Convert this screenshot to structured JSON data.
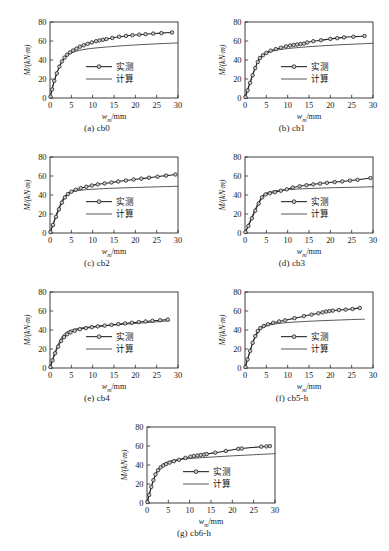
{
  "figure": {
    "axis": {
      "xlabel_var": "w",
      "xlabel_sub": "m",
      "xlabel_unit": "/mm",
      "ylabel": "M/(kN·m)",
      "ylabel_var": "M",
      "ylabel_unit": "/(kN·m)",
      "xticks": [
        "0",
        "5",
        "10",
        "15",
        "20",
        "25",
        "30"
      ],
      "yticks": [
        "0",
        "20",
        "40",
        "60",
        "80"
      ],
      "xlim": [
        0,
        30
      ],
      "ylim": [
        0,
        80
      ]
    },
    "legend": {
      "measured_label": "实测",
      "calculated_label": "计算"
    },
    "colors": {
      "measured_line": "#1f1f1f",
      "calculated_line": "#3a3a3a",
      "marker_fill": "#c9c9c9",
      "frame": "#2a2a2a",
      "background": "#ffffff"
    }
  },
  "chart_data": [
    {
      "type": "line",
      "panel": "a",
      "caption": "(a) cb0",
      "title": "cb0",
      "xlabel": "w_m/mm",
      "ylabel": "M/(kN·m)",
      "xlim": [
        0,
        30
      ],
      "ylim": [
        0,
        80
      ],
      "grid": false,
      "legend_position": "center",
      "series": [
        {
          "name": "实测",
          "marker": "circle",
          "x": [
            0.1,
            0.5,
            1.0,
            1.6,
            2.2,
            2.8,
            3.4,
            4.0,
            4.7,
            5.4,
            6.2,
            7.0,
            7.9,
            8.8,
            9.8,
            10.8,
            11.6,
            12.4,
            13.2,
            14.6,
            16.2,
            17.8,
            19.3,
            20.9,
            22.4,
            24.2,
            26.1,
            28.6
          ],
          "values": [
            1.5,
            9.0,
            18.0,
            26.0,
            33.0,
            38.5,
            42.5,
            45.5,
            48.0,
            50.0,
            52.0,
            54.0,
            55.5,
            57.0,
            58.5,
            59.8,
            60.6,
            61.3,
            62.0,
            63.2,
            64.5,
            65.4,
            66.1,
            66.7,
            67.2,
            67.8,
            68.3,
            69.0
          ]
        },
        {
          "name": "计算",
          "marker": "none",
          "x": [
            0,
            0.5,
            1.2,
            2.0,
            2.8,
            3.6,
            4.4,
            5.5,
            7.0,
            9.0,
            11.0,
            13.0,
            15.0,
            18.0,
            21.0,
            24.0,
            27.0,
            30.0
          ],
          "values": [
            0,
            10.0,
            21.0,
            31.0,
            38.5,
            43.0,
            46.0,
            48.3,
            50.2,
            51.8,
            52.8,
            53.6,
            54.3,
            55.3,
            56.1,
            56.8,
            57.4,
            58.0
          ]
        }
      ]
    },
    {
      "type": "line",
      "panel": "b",
      "caption": "(b) cb1",
      "title": "cb1",
      "xlabel": "w_m/mm",
      "ylabel": "M/(kN·m)",
      "xlim": [
        0,
        30
      ],
      "ylim": [
        0,
        80
      ],
      "grid": false,
      "legend_position": "center",
      "series": [
        {
          "name": "实测",
          "marker": "circle",
          "x": [
            0.1,
            0.6,
            1.2,
            1.8,
            2.4,
            3.0,
            3.5,
            4.2,
            5.0,
            6.0,
            7.2,
            8.4,
            9.6,
            10.6,
            11.4,
            12.2,
            13.0,
            13.8,
            14.6,
            16.0,
            17.8,
            20.0,
            21.6,
            23.2,
            25.4,
            28.0
          ],
          "values": [
            1.0,
            8.0,
            16.0,
            24.0,
            31.5,
            38.0,
            42.0,
            45.0,
            47.5,
            49.8,
            51.5,
            53.0,
            54.3,
            55.2,
            55.8,
            56.3,
            56.8,
            57.3,
            58.5,
            59.8,
            60.8,
            62.2,
            63.0,
            63.8,
            64.5,
            65.2
          ]
        },
        {
          "name": "计算",
          "marker": "none",
          "x": [
            0,
            0.6,
            1.4,
            2.2,
            3.0,
            3.8,
            4.8,
            6.0,
            8.0,
            10.0,
            12.0,
            15.0,
            18.0,
            21.0,
            24.0,
            27.0,
            30.0
          ],
          "values": [
            0,
            9.0,
            20.0,
            30.0,
            38.0,
            43.0,
            46.5,
            48.8,
            50.8,
            52.0,
            52.9,
            54.0,
            54.9,
            55.7,
            56.4,
            57.0,
            57.6
          ]
        }
      ]
    },
    {
      "type": "line",
      "panel": "c",
      "caption": "(c) cb2",
      "title": "cb2",
      "xlabel": "w_m/mm",
      "ylabel": "M/(kN·m)",
      "xlim": [
        0,
        30
      ],
      "ylim": [
        0,
        80
      ],
      "grid": false,
      "legend_position": "center",
      "series": [
        {
          "name": "实测",
          "marker": "circle",
          "x": [
            0.1,
            0.7,
            1.4,
            2.1,
            2.8,
            3.5,
            4.2,
            5.0,
            6.0,
            7.2,
            8.5,
            9.8,
            11.2,
            12.8,
            14.4,
            16.0,
            17.8,
            19.6,
            21.4,
            23.2,
            25.2,
            27.2,
            29.4
          ],
          "values": [
            1.0,
            8.5,
            17.0,
            25.0,
            32.0,
            37.5,
            41.0,
            43.5,
            45.5,
            47.2,
            48.6,
            50.0,
            51.2,
            52.2,
            53.2,
            54.2,
            55.3,
            56.3,
            57.2,
            58.2,
            59.3,
            60.4,
            61.6
          ]
        },
        {
          "name": "计算",
          "marker": "none",
          "x": [
            0,
            0.7,
            1.5,
            2.3,
            3.1,
            4.0,
            5.0,
            6.5,
            8.5,
            11.0,
            14.0,
            17.0,
            20.0,
            23.0,
            26.0,
            30.0
          ],
          "values": [
            0,
            9.5,
            20.0,
            29.0,
            36.5,
            41.0,
            43.2,
            44.6,
            45.6,
            46.3,
            47.0,
            47.5,
            47.9,
            48.3,
            48.7,
            49.2
          ]
        }
      ]
    },
    {
      "type": "line",
      "panel": "d",
      "caption": "(d) cb3",
      "title": "cb3",
      "xlabel": "w_m/mm",
      "ylabel": "M/(kN·m)",
      "xlim": [
        0,
        30
      ],
      "ylim": [
        0,
        80
      ],
      "grid": false,
      "legend_position": "center",
      "series": [
        {
          "name": "实测",
          "marker": "circle",
          "x": [
            0.1,
            0.8,
            1.6,
            2.4,
            3.2,
            4.0,
            4.8,
            5.8,
            7.0,
            8.4,
            9.8,
            11.2,
            12.8,
            14.4,
            16.0,
            17.6,
            19.2,
            21.0,
            22.8,
            24.6,
            26.4,
            29.4
          ],
          "values": [
            1.0,
            7.5,
            15.5,
            23.5,
            31.0,
            37.5,
            40.5,
            41.8,
            43.0,
            44.5,
            46.0,
            47.8,
            49.2,
            50.3,
            51.2,
            52.0,
            52.8,
            53.6,
            54.3,
            55.2,
            56.0,
            57.8
          ]
        },
        {
          "name": "计算",
          "marker": "none",
          "x": [
            0,
            0.8,
            1.7,
            2.6,
            3.5,
            4.4,
            5.5,
            7.0,
            9.0,
            12.0,
            15.0,
            18.0,
            21.0,
            24.0,
            27.0,
            30.0
          ],
          "values": [
            0,
            8.5,
            18.0,
            27.0,
            35.0,
            40.5,
            43.0,
            44.4,
            45.3,
            46.2,
            46.8,
            47.3,
            47.7,
            48.0,
            48.3,
            48.7
          ]
        }
      ]
    },
    {
      "type": "line",
      "panel": "e",
      "caption": "(e) cb4",
      "title": "cb4",
      "xlabel": "w_m/mm",
      "ylabel": "M/(kN·m)",
      "xlim": [
        0,
        30
      ],
      "ylim": [
        0,
        80
      ],
      "grid": false,
      "legend_position": "center",
      "series": [
        {
          "name": "实测",
          "marker": "circle",
          "x": [
            0.1,
            0.6,
            1.2,
            1.9,
            2.6,
            3.3,
            4.0,
            4.8,
            5.8,
            7.0,
            8.4,
            9.8,
            11.2,
            12.8,
            14.4,
            16.0,
            17.6,
            19.2,
            20.8,
            22.4,
            24.0,
            25.8,
            27.6
          ],
          "values": [
            1.0,
            8.0,
            15.5,
            22.5,
            28.5,
            32.5,
            35.5,
            37.5,
            39.2,
            40.8,
            42.0,
            43.0,
            43.8,
            44.6,
            45.4,
            46.2,
            46.9,
            47.6,
            48.3,
            49.0,
            49.7,
            50.3,
            51.0
          ]
        },
        {
          "name": "计算",
          "marker": "none",
          "x": [
            0,
            0.6,
            1.3,
            2.1,
            2.9,
            3.8,
            4.8,
            6.0,
            8.0,
            10.0,
            13.0,
            16.0,
            19.0,
            22.0,
            25.0,
            28.0
          ],
          "values": [
            0,
            9.0,
            18.5,
            27.0,
            33.5,
            37.5,
            39.8,
            41.2,
            42.6,
            43.5,
            44.6,
            45.6,
            46.6,
            47.6,
            48.6,
            49.8
          ]
        }
      ]
    },
    {
      "type": "line",
      "panel": "f",
      "caption": "(f) cb5-h",
      "title": "cb5-h",
      "xlabel": "w_m/mm",
      "ylabel": "M/(kN·m)",
      "xlim": [
        0,
        30
      ],
      "ylim": [
        0,
        80
      ],
      "grid": false,
      "legend_position": "center",
      "series": [
        {
          "name": "实测",
          "marker": "circle",
          "x": [
            0.1,
            0.6,
            1.2,
            1.8,
            2.4,
            3.0,
            3.6,
            4.4,
            5.4,
            6.6,
            8.0,
            9.4,
            11.6,
            13.8,
            15.6,
            17.2,
            18.2,
            19.0,
            19.8,
            20.6,
            22.0,
            23.6,
            25.2,
            26.9
          ],
          "values": [
            1.0,
            9.0,
            18.0,
            26.5,
            33.5,
            39.0,
            42.0,
            44.2,
            46.0,
            47.6,
            49.0,
            50.2,
            52.5,
            54.6,
            56.2,
            57.6,
            58.6,
            59.4,
            60.0,
            60.4,
            61.0,
            61.5,
            62.2,
            63.2
          ]
        },
        {
          "name": "计算",
          "marker": "none",
          "x": [
            0,
            0.6,
            1.3,
            2.0,
            2.8,
            3.6,
            4.6,
            6.0,
            8.0,
            10.5,
            13.0,
            16.0,
            19.0,
            22.0,
            25.0,
            28.0
          ],
          "values": [
            0,
            9.5,
            19.5,
            28.5,
            35.5,
            40.5,
            43.5,
            45.6,
            47.0,
            48.0,
            48.7,
            49.4,
            50.0,
            50.5,
            51.0,
            51.4
          ]
        }
      ]
    },
    {
      "type": "line",
      "panel": "g",
      "caption": "(g) cb6-h",
      "title": "cb6-h",
      "xlabel": "w_m/mm",
      "ylabel": "M/(kN·m)",
      "xlim": [
        0,
        30
      ],
      "ylim": [
        0,
        80
      ],
      "grid": false,
      "legend_position": "center",
      "series": [
        {
          "name": "实测",
          "marker": "circle",
          "x": [
            0.1,
            0.5,
            1.0,
            1.5,
            2.0,
            2.6,
            3.2,
            3.8,
            4.5,
            5.3,
            6.3,
            7.5,
            9.0,
            10.2,
            11.0,
            11.8,
            12.6,
            13.4,
            14.0,
            16.0,
            18.5,
            21.4,
            22.2,
            26.8,
            28.0,
            28.8
          ],
          "values": [
            1.0,
            8.5,
            17.0,
            24.0,
            30.0,
            34.5,
            37.5,
            39.5,
            41.0,
            42.5,
            44.0,
            45.5,
            47.5,
            48.8,
            49.5,
            50.0,
            50.5,
            51.0,
            51.5,
            53.0,
            54.8,
            57.0,
            57.3,
            59.3,
            59.6,
            59.9
          ]
        },
        {
          "name": "计算",
          "marker": "none",
          "x": [
            0,
            0.5,
            1.1,
            1.8,
            2.5,
            3.3,
            4.2,
            5.5,
            7.5,
            10.0,
            13.0,
            16.0,
            19.0,
            22.0,
            25.0,
            28.0,
            30.0
          ],
          "values": [
            0,
            8.5,
            18.0,
            27.0,
            34.0,
            39.0,
            42.0,
            44.3,
            45.8,
            46.8,
            47.8,
            48.6,
            49.4,
            50.1,
            50.8,
            51.5,
            51.9
          ]
        }
      ]
    }
  ]
}
